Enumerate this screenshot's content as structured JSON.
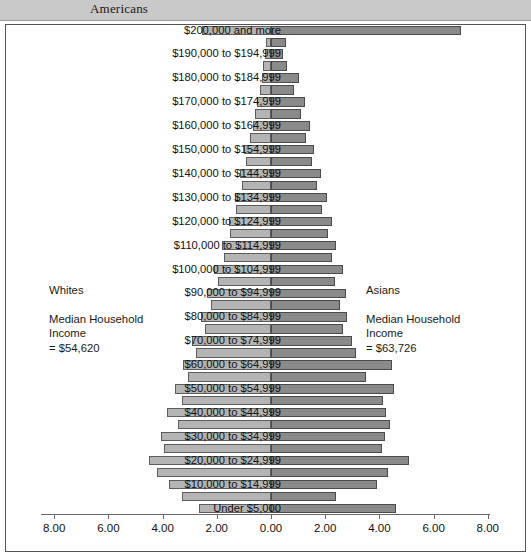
{
  "header": {
    "title": "Americans"
  },
  "annotations": {
    "left": {
      "group": "Whites",
      "line1": "Median Household",
      "line2": "Income",
      "line3": "= $54,620"
    },
    "right": {
      "group": "Asians",
      "line1": "Median Household",
      "line2": "Income",
      "line3": "= $63,726"
    }
  },
  "axis": {
    "tick_labels": [
      "8.00",
      "6.00",
      "4.00",
      "2.00",
      "0.00",
      "2.00",
      "4.00",
      "6.00",
      "8.00"
    ]
  },
  "chart_data": {
    "type": "bar",
    "title": "Americans",
    "subtype": "population-pyramid",
    "orientation": "horizontal-diverging",
    "xlabel": "",
    "ylabel": "",
    "xlim": [
      -8,
      8
    ],
    "grid": false,
    "legend_position": "none",
    "left_series": "Whites",
    "right_series": "Asians",
    "categories": [
      "$200,000 and more",
      "$195,000 to $199,999",
      "$190,000 to $194,999",
      "$185,000 to $189,999",
      "$180,000 to $184,999",
      "$175,000 to $179,999",
      "$170,000 to $174,999",
      "$165,000 to $169,999",
      "$160,000 to $164,999",
      "$155,000 to $159,999",
      "$150,000 to $154,999",
      "$145,000 to $149,999",
      "$140,000 to $144,999",
      "$135,000 to $139,999",
      "$130,000 to $134,999",
      "$125,000 to $129,999",
      "$120,000 to $124,999",
      "$115,000 to $119,999",
      "$110,000 to $114,999",
      "$105,000 to $109,999",
      "$100,000 to $104,999",
      "$95,000 to $99,999",
      "$90,000 to $94,999",
      "$85,000 to $89,999",
      "$80,000 to $84,999",
      "$75,000 to $79,999",
      "$70,000 to $74,999",
      "$65,000 to $69,999",
      "$60,000 to $64,999",
      "$55,000 to $59,999",
      "$50,000 to $54,999",
      "$45,000 to $49,999",
      "$40,000 to $44,999",
      "$35,000 to $39,999",
      "$30,000 to $34,999",
      "$25,000 to $29,999",
      "$20,000 to $24,999",
      "$15,000 to $19,999",
      "$10,000 to $14,999",
      "$5,000 to $9,999",
      "Under $5,000"
    ],
    "visible_category_labels": [
      "$200,000 and more",
      "$190,000 to $194,999",
      "$180,000 to $184,999",
      "$170,000 to $174,999",
      "$160,000 to $164,999",
      "$150,000 to $154,999",
      "$140,000 to $144,999",
      "$130,000 to $134,999",
      "$120,000 to $124,999",
      "$110,000 to $114,999",
      "$100,000 to $104,999",
      "$90,000 to $94,999",
      "$80,000 to $84,999",
      "$70,000 to $74,999",
      "$60,000 to $64,999",
      "$50,000 to $54,999",
      "$40,000 to $44,999",
      "$30,000 to $34,999",
      "$20,000 to $24,999",
      "$10,000 to $14,999",
      "Under $5,000"
    ],
    "series": [
      {
        "name": "Whites",
        "color": "#b4b4b4",
        "values": [
          2.55,
          0.18,
          0.22,
          0.28,
          0.35,
          0.42,
          0.5,
          0.58,
          0.68,
          0.78,
          1.0,
          0.92,
          1.15,
          1.08,
          1.32,
          1.28,
          1.55,
          1.5,
          1.8,
          1.75,
          2.1,
          1.95,
          2.35,
          2.2,
          2.6,
          2.45,
          2.9,
          2.75,
          3.25,
          3.05,
          3.55,
          3.3,
          3.85,
          3.45,
          4.05,
          3.95,
          4.5,
          4.2,
          3.75,
          3.3,
          2.65
        ]
      },
      {
        "name": "Asians",
        "color": "#8a8a8a",
        "values": [
          7.0,
          0.55,
          0.45,
          0.6,
          1.05,
          0.85,
          1.25,
          1.1,
          1.45,
          1.3,
          1.6,
          1.5,
          1.85,
          1.7,
          2.05,
          1.9,
          2.25,
          2.1,
          2.4,
          2.25,
          2.65,
          2.35,
          2.75,
          2.55,
          2.8,
          2.65,
          3.0,
          3.15,
          4.45,
          3.5,
          4.55,
          4.15,
          4.25,
          4.4,
          4.2,
          4.1,
          5.1,
          4.3,
          3.9,
          2.4,
          4.6
        ]
      }
    ]
  }
}
